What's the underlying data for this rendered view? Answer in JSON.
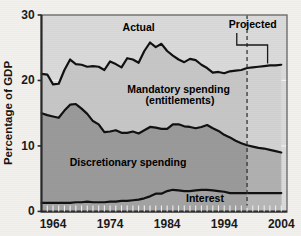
{
  "chart_data": {
    "type": "area",
    "title": "",
    "subtitle": "",
    "xlabel": "",
    "ylabel": "Percentage of GDP",
    "xlim": [
      1962,
      2005
    ],
    "ylim": [
      0,
      30
    ],
    "grid": true,
    "grid_levels": [
      10,
      20
    ],
    "legend_position": "inline-annotations",
    "x_tick_labels": [
      "1964",
      "1974",
      "1984",
      "1994",
      "2004"
    ],
    "x_tick_values": [
      1964,
      1974,
      1984,
      1994,
      2004
    ],
    "y_tick_labels": [
      "0",
      "10",
      "20",
      "30"
    ],
    "y_tick_values": [
      0,
      10,
      20,
      30
    ],
    "minor_x_ticks": [
      1963,
      1964,
      1965,
      1966,
      1967,
      1968,
      1969,
      1970,
      1971,
      1972,
      1973,
      1974,
      1975,
      1976,
      1977,
      1978,
      1979,
      1980,
      1981,
      1982,
      1983,
      1984,
      1985,
      1986,
      1987,
      1988,
      1989,
      1990,
      1991,
      1992,
      1993,
      1994,
      1995,
      1996,
      1997,
      1998,
      1999,
      2000,
      2001,
      2002,
      2003,
      2004
    ],
    "x": [
      1962,
      1963,
      1964,
      1965,
      1966,
      1967,
      1968,
      1969,
      1970,
      1971,
      1972,
      1973,
      1974,
      1975,
      1976,
      1977,
      1978,
      1979,
      1980,
      1981,
      1982,
      1983,
      1984,
      1985,
      1986,
      1987,
      1988,
      1989,
      1990,
      1991,
      1992,
      1993,
      1994,
      1995,
      1996,
      1997,
      1998,
      1999,
      2000,
      2001,
      2002,
      2003,
      2004
    ],
    "series": [
      {
        "name": "Interest",
        "label": "Interest",
        "fill_color": "#a3a3a3",
        "line_color": "#111111",
        "values": [
          1.3,
          1.3,
          1.3,
          1.3,
          1.3,
          1.3,
          1.4,
          1.4,
          1.5,
          1.4,
          1.4,
          1.4,
          1.5,
          1.5,
          1.6,
          1.6,
          1.7,
          1.8,
          2.0,
          2.3,
          2.7,
          2.7,
          3.1,
          3.3,
          3.2,
          3.1,
          3.1,
          3.2,
          3.3,
          3.3,
          3.2,
          3.1,
          3.0,
          2.8,
          2.8,
          2.8,
          2.8,
          2.8,
          2.8,
          2.8,
          2.8,
          2.8,
          2.8
        ]
      },
      {
        "name": "Discretionary spending",
        "label": "Discretionary spending",
        "fill_color": "#9a9a9a",
        "line_color": "#111111",
        "stack_top_values": [
          15.0,
          14.7,
          14.5,
          14.3,
          15.4,
          16.3,
          16.4,
          15.7,
          14.9,
          13.8,
          13.3,
          12.1,
          12.2,
          12.4,
          12.0,
          12.0,
          12.2,
          11.9,
          12.4,
          12.9,
          12.8,
          12.6,
          12.6,
          13.3,
          13.3,
          13.0,
          12.9,
          12.7,
          12.9,
          13.2,
          12.7,
          12.3,
          11.7,
          11.3,
          10.8,
          10.4,
          10.1,
          9.9,
          9.7,
          9.6,
          9.4,
          9.2,
          9.0
        ]
      },
      {
        "name": "Mandatory spending (entitlements)",
        "label": "Mandatory spending\n(entitlements)",
        "fill_color": "#c6c6c6",
        "line_color": "#111111",
        "stack_top_values": [
          21.0,
          20.9,
          19.4,
          19.5,
          21.6,
          23.2,
          22.5,
          22.4,
          22.1,
          22.2,
          22.1,
          21.6,
          22.9,
          22.5,
          22.0,
          23.4,
          23.2,
          22.7,
          24.5,
          25.8,
          25.1,
          25.6,
          24.5,
          23.8,
          23.2,
          22.8,
          23.3,
          23.1,
          22.4,
          21.9,
          21.2,
          21.3,
          21.1,
          21.4,
          21.5,
          21.6,
          21.9,
          22.0,
          22.1,
          22.2,
          22.3,
          22.3,
          22.4
        ]
      }
    ],
    "annotations": [
      {
        "name": "actual",
        "text": "Actual",
        "x": 1979,
        "y": 27.5
      },
      {
        "name": "projected",
        "text": "Projected",
        "x": 1999,
        "y": 28.0
      },
      {
        "name": "divider",
        "text": "",
        "x": 1998,
        "style": "dashed-vertical"
      }
    ],
    "projection_start_year": 1998
  },
  "colors": {
    "background": "#f2f0ec",
    "plot_background": "#d9d9d9",
    "projected_background": "#d0d0d0",
    "band_mandatory": "#c6c6c6",
    "band_discretionary": "#9a9a9a",
    "band_interest": "#a3a3a3",
    "line": "#111111",
    "grid": "#efefef",
    "axis": "#5a5a5a",
    "text": "#141414"
  },
  "axis": {
    "y_title": "Percentage of GDP"
  }
}
